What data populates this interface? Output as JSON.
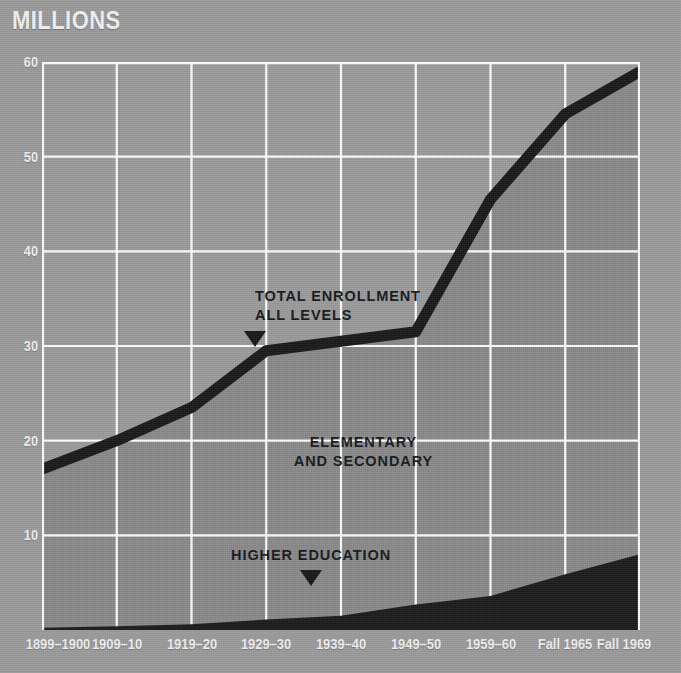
{
  "figure": {
    "axis_title": "MILLIONS",
    "background_color": "#9b9b9b",
    "plot_fill_color": "#8a8a8a",
    "band_color": "#1b1b1b",
    "line_color": "#191919",
    "grid_color": "#ffffff",
    "tick_label_color": "#efefef",
    "annotation_color": "#15191c"
  },
  "annotations": {
    "total": {
      "line1": "TOTAL ENROLLMENT",
      "line2": "ALL LEVELS",
      "marker": "down-triangle"
    },
    "elementary": {
      "line1": "ELEMENTARY",
      "line2": "AND SECONDARY"
    },
    "higher": {
      "line1": "HIGHER EDUCATION",
      "marker": "down-triangle"
    }
  },
  "chart_data": {
    "type": "area",
    "title": "MILLIONS",
    "xlabel": "",
    "ylabel": "MILLIONS",
    "ylim": [
      0,
      60
    ],
    "yticks": [
      60,
      50,
      40,
      30,
      20,
      10
    ],
    "grid": true,
    "legend": "inline-annotations",
    "categories": [
      "1899–1900",
      "1909–10",
      "1919–20",
      "1929–30",
      "1939–40",
      "1949–50",
      "1959–60",
      "Fall 1965",
      "Fall 1969"
    ],
    "series": [
      {
        "name": "TOTAL ENROLLMENT ALL LEVELS",
        "values": [
          17.0,
          20.0,
          23.5,
          29.5,
          30.5,
          31.5,
          45.5,
          54.5,
          59.0
        ]
      },
      {
        "name": "HIGHER EDUCATION",
        "values": [
          0.25,
          0.4,
          0.6,
          1.1,
          1.5,
          2.7,
          3.6,
          5.9,
          8.0
        ]
      },
      {
        "name": "ELEMENTARY AND SECONDARY",
        "values": [
          16.75,
          19.6,
          22.9,
          28.4,
          29.0,
          28.8,
          41.9,
          48.6,
          51.0
        ]
      }
    ]
  }
}
